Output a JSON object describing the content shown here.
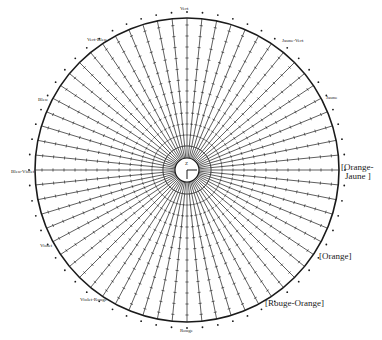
{
  "figure": {
    "type": "chromatic-circle",
    "center": [
      187,
      170
    ],
    "outer_radius": 152,
    "inner_radius": 12,
    "spoke_count": 64,
    "line_color": "#1a1a1a",
    "background": "#ffffff"
  },
  "center_mark": {
    "label": "Z"
  },
  "labels": {
    "top": "Vert",
    "top_left": "Vert-Bleu",
    "upper_left": "Bleu",
    "left": "Bleu-Violet",
    "lower_left": "Violet",
    "bottom_left": "Violet-Rouge",
    "bottom": "Rouge",
    "top_right": "Jaune-Vert",
    "upper_right": "Jaune"
  },
  "bracket_labels": {
    "orange_jaune_line1": "[Orange-",
    "orange_jaune_line2": "Jaune ]",
    "orange": "[Orange]",
    "rouge_orange": "[Rouge-Orange]"
  }
}
